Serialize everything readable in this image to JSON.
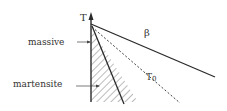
{
  "diagram": {
    "axis_label": "T",
    "labels": {
      "massive": "massive",
      "martensite": "martensite",
      "beta": "β",
      "t0": "T",
      "t0_sub": "0"
    },
    "colors": {
      "line": "#2a2a2a",
      "text": "#333333",
      "hatch": "#555555"
    }
  }
}
